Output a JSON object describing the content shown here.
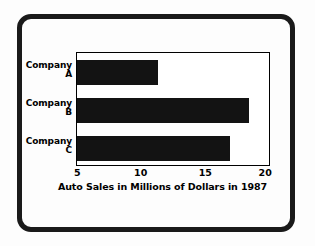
{
  "chart_data": {
    "type": "bar",
    "orientation": "horizontal",
    "title": "",
    "categories": [
      "Company A",
      "Company B",
      "Company C"
    ],
    "category_lines": [
      [
        "Company",
        "A"
      ],
      [
        "Company",
        "B"
      ],
      [
        "Company",
        "C"
      ]
    ],
    "values": [
      11.3,
      18.3,
      16.8
    ],
    "xlabel": "Auto Sales in Millions of Dollars in 1987",
    "ylabel": "",
    "xlim": [
      5,
      20
    ],
    "xticks": [
      5,
      10,
      15,
      20
    ],
    "xtick_labels": [
      "5",
      "10",
      "15",
      "20"
    ],
    "grid": false,
    "legend": false,
    "bar_color": "#131313",
    "plot_background": "#ffffff",
    "axis_color": "#000000"
  },
  "figure": {
    "caption": "Auto Sales in Millions of Dollars in 1987",
    "frame_color": "#1a1a1a",
    "page_background": "#fdfdfd"
  }
}
